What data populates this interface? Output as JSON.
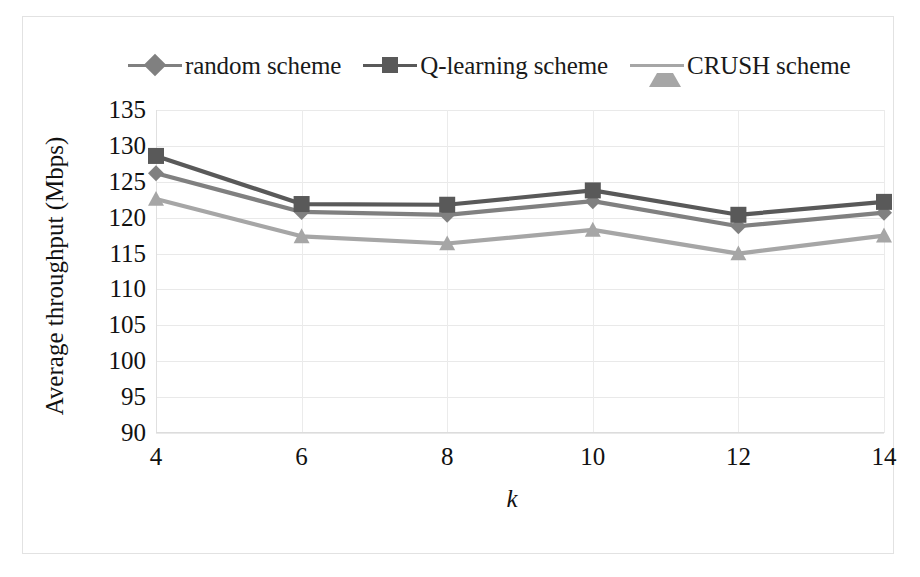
{
  "chart_data": {
    "type": "line",
    "title": "",
    "xlabel": "k",
    "ylabel": "Average throughput (Mbps)",
    "x": [
      4,
      6,
      8,
      10,
      12,
      14
    ],
    "xtick_labels": [
      "4",
      "6",
      "8",
      "10",
      "12",
      "14"
    ],
    "ytick_labels": [
      "135",
      "130",
      "125",
      "120",
      "115",
      "110",
      "105",
      "100",
      "95",
      "90"
    ],
    "yticks": [
      135,
      130,
      125,
      120,
      115,
      110,
      105,
      100,
      95,
      90
    ],
    "ylim": [
      90,
      135
    ],
    "xlim": [
      4,
      14
    ],
    "grid": true,
    "legend_position": "top",
    "series": [
      {
        "name": "random scheme",
        "marker": "diamond",
        "color": "#808080",
        "values": [
          126.2,
          120.8,
          120.4,
          122.3,
          118.8,
          120.7
        ]
      },
      {
        "name": "Q-learning scheme",
        "marker": "square",
        "color": "#595959",
        "values": [
          128.6,
          121.9,
          121.8,
          123.8,
          120.4,
          122.2
        ]
      },
      {
        "name": "CRUSH scheme",
        "marker": "triangle",
        "color": "#a6a6a6",
        "values": [
          122.6,
          117.4,
          116.4,
          118.3,
          115.0,
          117.5
        ]
      }
    ]
  },
  "legend": {
    "items": [
      {
        "label": "random scheme",
        "marker": "diamond",
        "color": "#808080"
      },
      {
        "label": "Q-learning scheme",
        "marker": "square",
        "color": "#595959"
      },
      {
        "label": "CRUSH scheme",
        "marker": "triangle",
        "color": "#a6a6a6"
      }
    ]
  },
  "axes": {
    "y_title": "Average throughput (Mbps)",
    "x_title": "k"
  }
}
